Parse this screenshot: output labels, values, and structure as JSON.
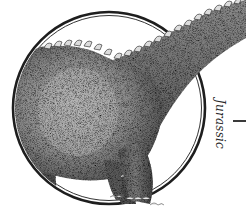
{
  "illustration": {
    "subject": "sauropod dinosaur",
    "style": "stippled engraving",
    "frame": "double-ring circle"
  },
  "label": {
    "era": "Jurassic"
  },
  "colors": {
    "ink": "#1e1e1e",
    "body_mid": "#6b6b6b",
    "body_light": "#9a9a9a",
    "background": "#ffffff"
  }
}
